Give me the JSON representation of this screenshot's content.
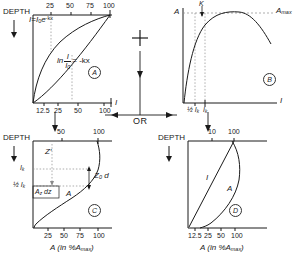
{
  "figure": {
    "type": "scientific-diagram",
    "connector_plus": "+",
    "connector_or": "OR"
  },
  "common": {
    "depth_label": "DEPTH",
    "axis_A_percent": "A (in %A",
    "axis_A_percent_sub": "max",
    "axis_A_percent_end": ")",
    "symbol_I": "I",
    "symbol_A": "A"
  },
  "panels": [
    {
      "id": "A",
      "key": "panel_a",
      "tag": "A",
      "depth_label": "DEPTH",
      "top_ticks": [
        "25",
        "50",
        "75",
        "100"
      ],
      "bottom_ticks": [
        "12.5",
        "25",
        "50",
        "100"
      ],
      "top_axis_symbol": "I",
      "bottom_axis_symbol": "I",
      "equation_exp": "I=I",
      "equation_exp_sub": "0",
      "equation_exp_e": "e",
      "equation_exp_pow": "-kx",
      "equation_log_ln": "ln",
      "equation_log_num": "I",
      "equation_log_den": "I",
      "equation_log_den_sub": "0",
      "equation_log_rhs": "= -kx"
    },
    {
      "id": "B",
      "key": "panel_b",
      "tag": "B",
      "y_axis_label": "A",
      "x_axis_label": "I",
      "amax_label": "A",
      "amax_sub": "max",
      "k_label": "K",
      "tick_half_ik": "½ I",
      "tick_half_ik_sub": "k",
      "tick_ik": "I",
      "tick_ik_sub": "k"
    },
    {
      "id": "C",
      "key": "panel_c",
      "tag": "C",
      "depth_label": "DEPTH",
      "top_ticks": [
        "50",
        "100"
      ],
      "bottom_ticks": [
        "25",
        "50",
        "75",
        "100"
      ],
      "x_axis_caption": "A (in %A",
      "x_axis_caption_sub": "max",
      "x_axis_caption_end": ")",
      "label_ik": "I",
      "label_ik_sub": "k",
      "label_half_ik": "½ I",
      "label_half_ik_sub": "k",
      "label_zprime": "Z′",
      "label_az_dz": "A",
      "label_az_dz_sub": "z",
      "label_az_dz_end": "dz",
      "label_z0d": "Z",
      "label_z0d_sub": "0",
      "label_z0d_end": "d",
      "curve_label_A": "A"
    },
    {
      "id": "D",
      "key": "panel_d",
      "tag": "D",
      "depth_label": "DEPTH",
      "top_ticks": [
        "10",
        "100"
      ],
      "bottom_ticks": [
        "12.5",
        "25",
        "50",
        "100"
      ],
      "x_axis_caption": "A (in %A",
      "x_axis_caption_sub": "max",
      "x_axis_caption_end": ")",
      "curve_label_I": "I",
      "curve_label_A": "A"
    }
  ],
  "colors": {
    "ink": "#1a1a1a",
    "guide": "#8a8a8a",
    "background": "#ffffff"
  }
}
